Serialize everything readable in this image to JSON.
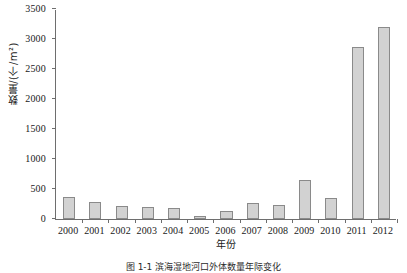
{
  "chart_data": {
    "type": "bar",
    "title": "",
    "xlabel": "年份",
    "ylabel": "数量/(个/m²)",
    "categories": [
      "2000",
      "2001",
      "2002",
      "2003",
      "2004",
      "2005",
      "2006",
      "2007",
      "2008",
      "2009",
      "2010",
      "2011",
      "2012"
    ],
    "values": [
      360,
      280,
      215,
      200,
      190,
      50,
      130,
      265,
      230,
      650,
      355,
      2870,
      3200
    ],
    "ylim": [
      0,
      3500
    ],
    "yticks": [
      0,
      500,
      1000,
      1500,
      2000,
      2500,
      3000,
      3500
    ],
    "ytick_labels": [
      "0",
      "500",
      "1000",
      "1500",
      "2000",
      "2500",
      "3000",
      "3500"
    ],
    "grid": false,
    "legend": "none",
    "bar_fill_color": "#d2d2d2",
    "bar_border_color": "#8a8a8a",
    "axis_color": "#6e6e6e"
  },
  "caption": {
    "text": "图 1-1  滨海湿地河口外体数量年际变化"
  }
}
